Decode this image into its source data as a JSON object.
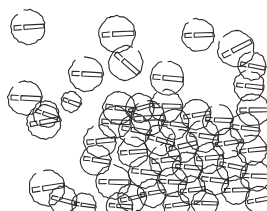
{
  "image": {
    "title": "Hand-drawn scatter of circular bolt-head glyphs",
    "width": 267,
    "height": 211,
    "background_color": "#ffffff",
    "stroke_color": "#2b2b2b",
    "style": "pen-and-ink line sketch, no fill, overlapping outlines",
    "alt_text": "About fifty hand-drawn circles, each containing a short horizontal stub on the left and a longer horizontal bar to the right, scattered sparsely across the top half and densely overlapping in the lower middle of a white field."
  },
  "motif": {
    "name": "circle-bolt-glyph",
    "description": "open circle outline enclosing a horizontal key-shaped bar: a small rectangular stub at the left and a longer rectangular bar extending to the right",
    "circle_radius_px": 15,
    "stroke_width_px": 1.1,
    "count": 52
  },
  "layout": {
    "density_note": "sparse upper half, dense overlapping cluster centred near x=175 y=150",
    "cluster_center": {
      "x": 175,
      "y": 150
    }
  },
  "glyphs": [
    {
      "x": 28,
      "y": 27,
      "r": 17,
      "rot": -4,
      "gap": 38
    },
    {
      "x": 25,
      "y": 98,
      "r": 17,
      "rot": 2,
      "gap": 36
    },
    {
      "x": 46,
      "y": 114,
      "r": 13,
      "rot": 18,
      "gap": 0
    },
    {
      "x": 86,
      "y": 74,
      "r": 17,
      "rot": 3,
      "gap": 34
    },
    {
      "x": 71,
      "y": 102,
      "r": 10,
      "rot": 20,
      "gap": 0
    },
    {
      "x": 117,
      "y": 34,
      "r": 18,
      "rot": -3,
      "gap": 0
    },
    {
      "x": 126,
      "y": 63,
      "r": 17,
      "rot": 42,
      "gap": 30
    },
    {
      "x": 119,
      "y": 108,
      "r": 16,
      "rot": 7,
      "gap": 0
    },
    {
      "x": 167,
      "y": 78,
      "r": 17,
      "rot": 5,
      "gap": 26
    },
    {
      "x": 198,
      "y": 35,
      "r": 16,
      "rot": -2,
      "gap": 22
    },
    {
      "x": 236,
      "y": 49,
      "r": 18,
      "rot": -28,
      "gap": 34
    },
    {
      "x": 252,
      "y": 66,
      "r": 14,
      "rot": 12,
      "gap": 26
    },
    {
      "x": 249,
      "y": 86,
      "r": 15,
      "rot": 6,
      "gap": 30
    },
    {
      "x": 253,
      "y": 110,
      "r": 16,
      "rot": 0,
      "gap": 0
    },
    {
      "x": 44,
      "y": 122,
      "r": 17,
      "rot": -10,
      "gap": 30
    },
    {
      "x": 47,
      "y": 188,
      "r": 18,
      "rot": -8,
      "gap": 34
    },
    {
      "x": 63,
      "y": 200,
      "r": 14,
      "rot": 14,
      "gap": 0
    },
    {
      "x": 115,
      "y": 122,
      "r": 16,
      "rot": 4,
      "gap": 0
    },
    {
      "x": 100,
      "y": 141,
      "r": 16,
      "rot": -6,
      "gap": 32
    },
    {
      "x": 96,
      "y": 160,
      "r": 15,
      "rot": 8,
      "gap": 0
    },
    {
      "x": 113,
      "y": 182,
      "r": 17,
      "rot": 2,
      "gap": 30
    },
    {
      "x": 132,
      "y": 198,
      "r": 14,
      "rot": -12,
      "gap": 0
    },
    {
      "x": 135,
      "y": 130,
      "r": 16,
      "rot": 10,
      "gap": 0
    },
    {
      "x": 133,
      "y": 152,
      "r": 15,
      "rot": -5,
      "gap": 26
    },
    {
      "x": 145,
      "y": 172,
      "r": 16,
      "rot": 6,
      "gap": 0
    },
    {
      "x": 152,
      "y": 193,
      "r": 14,
      "rot": -9,
      "gap": 0
    },
    {
      "x": 148,
      "y": 118,
      "r": 17,
      "rot": -3,
      "gap": 30
    },
    {
      "x": 160,
      "y": 140,
      "r": 15,
      "rot": 16,
      "gap": 0
    },
    {
      "x": 165,
      "y": 160,
      "r": 16,
      "rot": -7,
      "gap": 28
    },
    {
      "x": 172,
      "y": 182,
      "r": 15,
      "rot": 3,
      "gap": 0
    },
    {
      "x": 174,
      "y": 124,
      "r": 15,
      "rot": 8,
      "gap": 0
    },
    {
      "x": 182,
      "y": 146,
      "r": 16,
      "rot": -14,
      "gap": 26
    },
    {
      "x": 188,
      "y": 167,
      "r": 15,
      "rot": 5,
      "gap": 0
    },
    {
      "x": 192,
      "y": 190,
      "r": 14,
      "rot": -6,
      "gap": 0
    },
    {
      "x": 166,
      "y": 106,
      "r": 16,
      "rot": 2,
      "gap": 28
    },
    {
      "x": 196,
      "y": 115,
      "r": 15,
      "rot": -10,
      "gap": 0
    },
    {
      "x": 203,
      "y": 136,
      "r": 16,
      "rot": 9,
      "gap": 26
    },
    {
      "x": 209,
      "y": 158,
      "r": 15,
      "rot": -4,
      "gap": 0
    },
    {
      "x": 214,
      "y": 180,
      "r": 15,
      "rot": 7,
      "gap": 0
    },
    {
      "x": 140,
      "y": 108,
      "r": 14,
      "rot": -16,
      "gap": 0
    },
    {
      "x": 218,
      "y": 120,
      "r": 15,
      "rot": 4,
      "gap": 24
    },
    {
      "x": 228,
      "y": 143,
      "r": 15,
      "rot": -8,
      "gap": 0
    },
    {
      "x": 232,
      "y": 166,
      "r": 15,
      "rot": 11,
      "gap": 26
    },
    {
      "x": 236,
      "y": 190,
      "r": 14,
      "rot": -3,
      "gap": 0
    },
    {
      "x": 245,
      "y": 128,
      "r": 15,
      "rot": 6,
      "gap": 0
    },
    {
      "x": 252,
      "y": 150,
      "r": 15,
      "rot": -6,
      "gap": 24
    },
    {
      "x": 255,
      "y": 176,
      "r": 15,
      "rot": 3,
      "gap": 0
    },
    {
      "x": 259,
      "y": 200,
      "r": 14,
      "rot": -10,
      "gap": 0
    },
    {
      "x": 120,
      "y": 206,
      "r": 13,
      "rot": 5,
      "gap": 0
    },
    {
      "x": 176,
      "y": 205,
      "r": 13,
      "rot": -7,
      "gap": 0
    },
    {
      "x": 84,
      "y": 205,
      "r": 12,
      "rot": 9,
      "gap": 0
    },
    {
      "x": 205,
      "y": 203,
      "r": 13,
      "rot": 2,
      "gap": 0
    }
  ]
}
